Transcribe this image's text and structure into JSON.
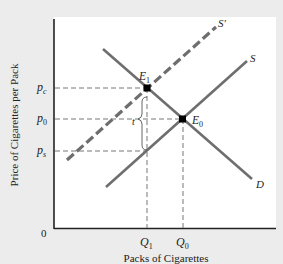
{
  "figure": {
    "title": "",
    "y_axis_label": "Price of  Cigarettes per Pack",
    "x_axis_label": "Packs of Cigarettes",
    "origin_label": "0",
    "price_labels": {
      "pc": {
        "base": "p",
        "sub": "c"
      },
      "p0": {
        "base": "p",
        "sub": "0"
      },
      "ps": {
        "base": "p",
        "sub": "s"
      }
    },
    "quantity_labels": {
      "q1": {
        "base": "Q",
        "sub": "1"
      },
      "q0": {
        "base": "Q",
        "sub": "0"
      }
    },
    "curves": {
      "demand": "D",
      "supply": "S",
      "supply_shifted": "S′"
    },
    "points": {
      "e1": {
        "base": "E",
        "sub": "1"
      },
      "e0": {
        "base": "E",
        "sub": "0"
      }
    },
    "tax_label": "t",
    "colors": {
      "background": "#ececec",
      "plot_bg": "#ffffff",
      "curve": "#6e6e6e",
      "axis": "#222222",
      "guide": "#777777",
      "point": "#000000"
    }
  }
}
